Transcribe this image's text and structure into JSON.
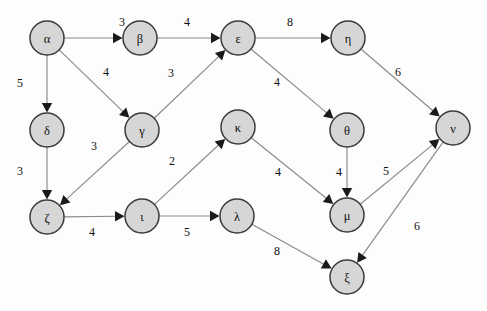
{
  "diagram": {
    "type": "weighted-directed-graph",
    "width": 487,
    "height": 311,
    "background_color": "#fdfdfd",
    "node_fill_color": "#d6d6d6",
    "node_stroke_color": "#3c3c3c",
    "edge_color": "#8a8a8a",
    "arrow_color": "#1a1a1a",
    "node_radius": 17
  },
  "nodes": [
    {
      "id": "alpha",
      "label": "α",
      "x": 47,
      "y": 38
    },
    {
      "id": "beta",
      "label": "β",
      "x": 140,
      "y": 38
    },
    {
      "id": "epsilon",
      "label": "ε",
      "x": 238,
      "y": 38
    },
    {
      "id": "eta",
      "label": "η",
      "x": 348,
      "y": 38
    },
    {
      "id": "delta",
      "label": "δ",
      "x": 47,
      "y": 130
    },
    {
      "id": "gamma",
      "label": "γ",
      "x": 142,
      "y": 130
    },
    {
      "id": "kappa",
      "label": "κ",
      "x": 238,
      "y": 127
    },
    {
      "id": "theta",
      "label": "θ",
      "x": 347,
      "y": 130
    },
    {
      "id": "nu",
      "label": "ν",
      "x": 453,
      "y": 128
    },
    {
      "id": "zeta",
      "label": "ζ",
      "x": 47,
      "y": 217
    },
    {
      "id": "iota",
      "label": "ι",
      "x": 142,
      "y": 216
    },
    {
      "id": "lambda",
      "label": "λ",
      "x": 237,
      "y": 216
    },
    {
      "id": "mu",
      "label": "μ",
      "x": 347,
      "y": 215
    },
    {
      "id": "xi",
      "label": "ξ",
      "x": 347,
      "y": 277
    }
  ],
  "edges": [
    {
      "id": "alpha-beta",
      "from": "alpha",
      "to": "beta",
      "weight": "3",
      "lx": 122,
      "ly": 22
    },
    {
      "id": "beta-epsilon",
      "from": "beta",
      "to": "epsilon",
      "weight": "4",
      "lx": 187,
      "ly": 22
    },
    {
      "id": "epsilon-eta",
      "from": "epsilon",
      "to": "eta",
      "weight": "8",
      "lx": 290,
      "ly": 22
    },
    {
      "id": "alpha-delta",
      "from": "alpha",
      "to": "delta",
      "weight": "5",
      "lx": 20,
      "ly": 83
    },
    {
      "id": "alpha-gamma",
      "from": "alpha",
      "to": "gamma",
      "weight": "4",
      "lx": 106,
      "ly": 72
    },
    {
      "id": "gamma-epsilon",
      "from": "gamma",
      "to": "epsilon",
      "weight": "3",
      "lx": 171,
      "ly": 73
    },
    {
      "id": "delta-zeta",
      "from": "delta",
      "to": "zeta",
      "weight": "3",
      "lx": 20,
      "ly": 171
    },
    {
      "id": "gamma-zeta",
      "from": "gamma",
      "to": "zeta",
      "weight": "3",
      "lx": 94,
      "ly": 146
    },
    {
      "id": "epsilon-theta",
      "from": "epsilon",
      "to": "theta",
      "weight": "4",
      "lx": 277,
      "ly": 82
    },
    {
      "id": "eta-nu",
      "from": "eta",
      "to": "nu",
      "weight": "6",
      "lx": 398,
      "ly": 72
    },
    {
      "id": "zeta-iota",
      "from": "zeta",
      "to": "iota",
      "weight": "4",
      "lx": 92,
      "ly": 232
    },
    {
      "id": "iota-kappa",
      "from": "iota",
      "to": "kappa",
      "weight": "2",
      "lx": 172,
      "ly": 161
    },
    {
      "id": "iota-lambda",
      "from": "iota",
      "to": "lambda",
      "weight": "5",
      "lx": 187,
      "ly": 232
    },
    {
      "id": "kappa-mu",
      "from": "kappa",
      "to": "mu",
      "weight": "4",
      "lx": 278,
      "ly": 172
    },
    {
      "id": "theta-mu",
      "from": "theta",
      "to": "mu",
      "weight": "4",
      "lx": 339,
      "ly": 172
    },
    {
      "id": "mu-nu",
      "from": "mu",
      "to": "nu",
      "weight": "5",
      "lx": 386,
      "ly": 171
    },
    {
      "id": "lambda-xi",
      "from": "lambda",
      "to": "xi",
      "weight": "8",
      "lx": 277,
      "ly": 251
    },
    {
      "id": "nu-xi",
      "from": "nu",
      "to": "xi",
      "weight": "6",
      "lx": 417,
      "ly": 226
    }
  ]
}
